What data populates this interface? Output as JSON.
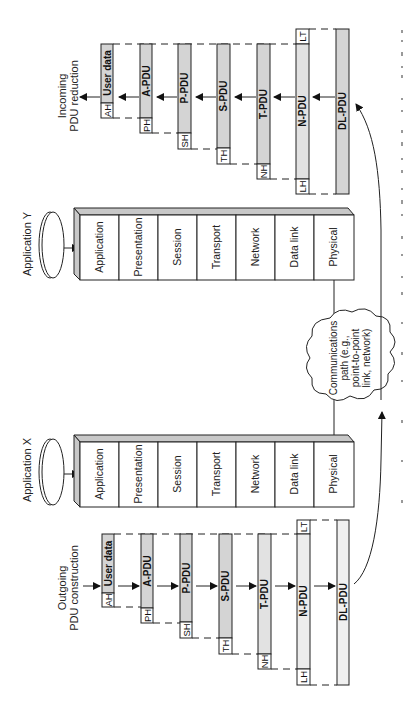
{
  "figure": {
    "orientation": "rotated-90-ccw",
    "colors": {
      "pdu_shade": "#d4d4d4",
      "bevel_shade": "#c8c8c8",
      "ink": "#222222",
      "background": "#ffffff"
    }
  },
  "incoming": {
    "title_line1": "Incoming",
    "title_line2": "PDU reduction",
    "pdus": [
      {
        "label": "User data",
        "header": "AH",
        "trailer": ""
      },
      {
        "label": "A-PDU",
        "header": "PH",
        "trailer": ""
      },
      {
        "label": "P-PDU",
        "header": "SH",
        "trailer": ""
      },
      {
        "label": "S-PDU",
        "header": "TH",
        "trailer": ""
      },
      {
        "label": "T-PDU",
        "header": "NH",
        "trailer": ""
      },
      {
        "label": "N-PDU",
        "header": "LH",
        "trailer": "LT"
      },
      {
        "label": "DL-PDU",
        "header": "",
        "trailer": ""
      }
    ]
  },
  "outgoing": {
    "title_line1": "Outgoing",
    "title_line2": "PDU construction",
    "pdus": [
      {
        "label": "User data",
        "header": "AH",
        "trailer": ""
      },
      {
        "label": "A-PDU",
        "header": "PH",
        "trailer": ""
      },
      {
        "label": "P-PDU",
        "header": "SH",
        "trailer": ""
      },
      {
        "label": "S-PDU",
        "header": "TH",
        "trailer": ""
      },
      {
        "label": "T-PDU",
        "header": "NH",
        "trailer": ""
      },
      {
        "label": "N-PDU",
        "header": "LH",
        "trailer": "LT"
      },
      {
        "label": "DL-PDU",
        "header": "",
        "trailer": ""
      }
    ]
  },
  "stacks": {
    "application_y": {
      "title": "Application Y",
      "layers": [
        "Application",
        "Presentation",
        "Session",
        "Transport",
        "Network",
        "Data link",
        "Physical"
      ]
    },
    "application_x": {
      "title": "Application X",
      "layers": [
        "Application",
        "Presentation",
        "Session",
        "Transport",
        "Network",
        "Data link",
        "Physical"
      ]
    }
  },
  "cloud": {
    "line1": "Communications",
    "line2": "path (e.g.,",
    "line3": "point-to-point",
    "line4": "link, network)"
  }
}
